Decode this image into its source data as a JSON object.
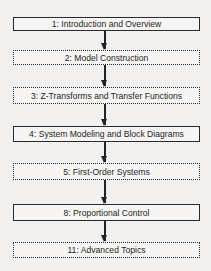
{
  "diagram": {
    "type": "flowchart",
    "nodes": [
      {
        "id": 1,
        "label": "1: Introduction and Overview",
        "style": "solid"
      },
      {
        "id": 2,
        "label": "2: Model Construction",
        "style": "dashed"
      },
      {
        "id": 3,
        "label": "3: Z-Transforms and Transfer Functions",
        "style": "dashed"
      },
      {
        "id": 4,
        "label": "4: System Modeling and Block Diagrams",
        "style": "solid"
      },
      {
        "id": 5,
        "label": "5: First-Order Systems",
        "style": "dashed"
      },
      {
        "id": 8,
        "label": "8: Proportional Control",
        "style": "solid"
      },
      {
        "id": 11,
        "label": "11: Advanced Topics",
        "style": "dashed"
      }
    ],
    "edges": [
      {
        "from": 1,
        "to": 2
      },
      {
        "from": 2,
        "to": 3
      },
      {
        "from": 3,
        "to": 4
      },
      {
        "from": 4,
        "to": 5
      },
      {
        "from": 5,
        "to": 8
      },
      {
        "from": 8,
        "to": 11
      }
    ]
  }
}
